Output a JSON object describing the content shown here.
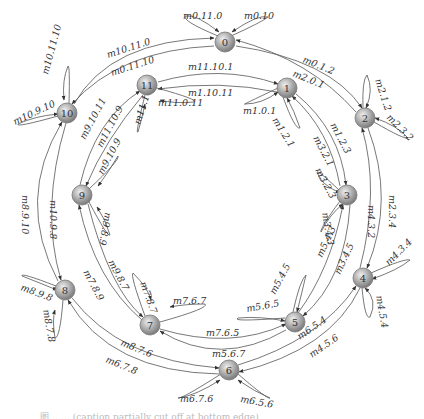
{
  "diagram": {
    "type": "state-transition-ring",
    "nodes": [
      {
        "id": "0",
        "x": 225,
        "y": 42
      },
      {
        "id": "1",
        "x": 287,
        "y": 88
      },
      {
        "id": "2",
        "x": 365,
        "y": 118
      },
      {
        "id": "3",
        "x": 347,
        "y": 195
      },
      {
        "id": "4",
        "x": 363,
        "y": 278
      },
      {
        "id": "5",
        "x": 295,
        "y": 322
      },
      {
        "id": "6",
        "x": 229,
        "y": 370
      },
      {
        "id": "7",
        "x": 150,
        "y": 325
      },
      {
        "id": "8",
        "x": 65,
        "y": 290
      },
      {
        "id": "9",
        "x": 82,
        "y": 195
      },
      {
        "id": "10",
        "x": 67,
        "y": 113
      },
      {
        "id": "11",
        "x": 147,
        "y": 85
      }
    ],
    "edges": [
      {
        "from": "0",
        "to": "2",
        "label": "m0.1.2",
        "path": "M236,46 Q330,60 362,108",
        "lx": 302,
        "ly": 62,
        "rot": 22
      },
      {
        "from": "2",
        "to": "0",
        "label": "m2.0.1",
        "path": "M356,112 Q310,60 236,40",
        "lx": 292,
        "ly": 76,
        "rot": 22
      },
      {
        "from": "0",
        "to": "10",
        "label": "m0.11.10",
        "path": "M214,46 Q120,50 72,104",
        "lx": 112,
        "ly": 76,
        "rot": -18
      },
      {
        "from": "10",
        "to": "0",
        "label": "m10.11.0",
        "path": "M74,104 Q110,40 214,38",
        "lx": 108,
        "ly": 58,
        "rot": -18
      },
      {
        "from": "11",
        "to": "1",
        "label": "m11.10.1",
        "path": "M158,82 Q220,64 278,84",
        "lx": 188,
        "ly": 70,
        "rot": 0
      },
      {
        "from": "1",
        "to": "11",
        "label": "m1.10.11",
        "path": "M277,92 Q220,80 158,89",
        "lx": 188,
        "ly": 96,
        "rot": 0
      },
      {
        "from": "1",
        "to": "3",
        "label": "m1.2.3",
        "path": "M296,94 Q340,130 346,185",
        "lx": 330,
        "ly": 125,
        "rot": 62
      },
      {
        "from": "3",
        "to": "1",
        "label": "m3.2.1",
        "path": "M340,186 Q330,130 292,96",
        "lx": 313,
        "ly": 138,
        "rot": 62
      },
      {
        "from": "2",
        "to": "4",
        "label": "m2.3.4",
        "path": "M368,128 Q395,200 367,268",
        "lx": 389,
        "ly": 195,
        "rot": 90
      },
      {
        "from": "4",
        "to": "2",
        "label": "m4.3.2",
        "path": "M360,268 Q380,190 362,128",
        "lx": 368,
        "ly": 205,
        "rot": 90
      },
      {
        "from": "3",
        "to": "5",
        "label": "m3.4.5",
        "path": "M350,205 Q345,280 303,316",
        "lx": 340,
        "ly": 275,
        "rot": -65
      },
      {
        "from": "5",
        "to": "3",
        "label": "m5.4.3",
        "path": "M298,313 Q330,270 343,205",
        "lx": 322,
        "ly": 258,
        "rot": -65
      },
      {
        "from": "4",
        "to": "6",
        "label": "m4.5.6",
        "path": "M360,288 Q330,350 239,372",
        "lx": 312,
        "ly": 358,
        "rot": -35
      },
      {
        "from": "6",
        "to": "4",
        "label": "m6.5.4",
        "path": "M238,365 Q320,340 356,286",
        "lx": 300,
        "ly": 340,
        "rot": -35
      },
      {
        "from": "7",
        "to": "5",
        "label": "m7.6.5",
        "path": "M160,329 Q230,350 286,324",
        "lx": 206,
        "ly": 336,
        "rot": 0
      },
      {
        "from": "5",
        "to": "7",
        "label": "m5.6.7",
        "path": "M286,330 Q220,368 160,331",
        "lx": 212,
        "ly": 357,
        "rot": 0
      },
      {
        "from": "8",
        "to": "6",
        "label": "m8.7.6",
        "path": "M72,298 Q120,360 219,368",
        "lx": 120,
        "ly": 345,
        "rot": 22
      },
      {
        "from": "6",
        "to": "8",
        "label": "m6.7.8",
        "path": "M219,374 Q110,372 68,300",
        "lx": 105,
        "ly": 362,
        "rot": 22
      },
      {
        "from": "9",
        "to": "7",
        "label": "m9.8.7",
        "path": "M88,204 Q110,290 143,317",
        "lx": 108,
        "ly": 262,
        "rot": 62
      },
      {
        "from": "7",
        "to": "9",
        "label": "m7.8.9",
        "path": "M142,320 Q95,280 79,205",
        "lx": 83,
        "ly": 272,
        "rot": 62
      },
      {
        "from": "10",
        "to": "8",
        "label": "m10.9.8",
        "path": "M66,123 Q40,210 61,280",
        "lx": 50,
        "ly": 200,
        "rot": 90
      },
      {
        "from": "8",
        "to": "10",
        "label": "m8.9.10",
        "path": "M58,281 Q15,200 62,122",
        "lx": 22,
        "ly": 195,
        "rot": 90
      },
      {
        "from": "9",
        "to": "11",
        "label": "m9.10.11",
        "path": "M80,185 Q95,120 140,91",
        "lx": 85,
        "ly": 140,
        "rot": -62
      },
      {
        "from": "11",
        "to": "9",
        "label": "m11.10.9",
        "path": "M143,95 Q105,140 86,186",
        "lx": 102,
        "ly": 148,
        "rot": -62
      }
    ],
    "loops": [
      {
        "node": "0",
        "label": "m0.11.0",
        "path": "M218,36 Q180,20 186,16 Q196,14 219,32",
        "lx": 183,
        "ly": 19,
        "rot": 0
      },
      {
        "node": "0",
        "label": "m0.10",
        "path": "M231,36 Q262,22 268,17 Q258,14 232,32",
        "lx": 244,
        "ly": 19,
        "rot": 0
      },
      {
        "node": "1",
        "label": "m1.0.1",
        "path": "M278,88 Q240,106 245,104 Q262,104 278,92",
        "lx": 243,
        "ly": 114,
        "rot": 0
      },
      {
        "node": "1",
        "label": "m1.2.1",
        "path": "M283,97 Q295,130 300,128 Q294,110 287,98",
        "lx": 272,
        "ly": 120,
        "rot": 58
      },
      {
        "node": "2",
        "label": "m2.1.2",
        "path": "M363,108 Q362,80 367,75 Q374,90 366,108",
        "lx": 375,
        "ly": 80,
        "rot": 72
      },
      {
        "node": "2",
        "label": "m2.3.2",
        "path": "M374,122 Q405,140 408,138 Q398,126 375,118",
        "lx": 386,
        "ly": 118,
        "rot": 45
      },
      {
        "node": "3",
        "label": "m3.2.3",
        "path": "M339,190 Q318,170 317,172 Q320,184 340,193",
        "lx": 315,
        "ly": 170,
        "rot": 62
      },
      {
        "node": "3",
        "label": "m3.4.3",
        "path": "M340,201 Q320,228 321,232 Q330,214 343,204",
        "lx": 322,
        "ly": 213,
        "rot": 80
      },
      {
        "node": "4",
        "label": "m4.3.4",
        "path": "M371,273 Q405,258 410,260 Q398,270 372,279",
        "lx": 389,
        "ly": 266,
        "rot": -45
      },
      {
        "node": "4",
        "label": "m4.5.4",
        "path": "M362,288 Q365,320 370,317 Q378,300 365,288",
        "lx": 376,
        "ly": 296,
        "rot": 80
      },
      {
        "node": "5",
        "label": "m5.4.5",
        "path": "M293,312 Q300,280 306,275 Q302,292 297,312",
        "lx": 275,
        "ly": 295,
        "rot": -62
      },
      {
        "node": "5",
        "label": "m5.6.5",
        "path": "M285,318 Q230,322 238,318 Q260,316 285,321",
        "lx": 247,
        "ly": 312,
        "rot": -10
      },
      {
        "node": "6",
        "label": "m6.7.6",
        "path": "M221,374 Q180,400 178,398 Q195,396 220,380",
        "lx": 180,
        "ly": 402,
        "rot": 0
      },
      {
        "node": "6",
        "label": "m6.5.6",
        "path": "M238,374 Q268,400 270,398 Q255,392 238,380",
        "lx": 240,
        "ly": 402,
        "rot": 10
      },
      {
        "node": "7",
        "label": "m7.6.7",
        "path": "M160,322 Q210,308 205,304 Q185,304 170,307",
        "lx": 173,
        "ly": 304,
        "rot": 0
      },
      {
        "node": "7",
        "label": "m7.8.7",
        "path": "M145,316 Q130,275 133,273 Q148,288 151,300",
        "lx": 140,
        "ly": 283,
        "rot": 70
      },
      {
        "node": "8",
        "label": "m8.9.8",
        "path": "M56,286 Q20,272 22,276 Q40,283 57,290",
        "lx": 20,
        "ly": 290,
        "rot": 20
      },
      {
        "node": "8",
        "label": "m8.7.8",
        "path": "M63,300 Q60,338 55,338 Q52,320 55,310",
        "lx": 43,
        "ly": 310,
        "rot": 80
      },
      {
        "node": "9",
        "label": "m9.10.9",
        "path": "M89,189 Q120,160 118,156 Q110,170 98,186",
        "lx": 103,
        "ly": 175,
        "rot": -62
      },
      {
        "node": "9",
        "label": "m9.8.9",
        "path": "M89,202 Q108,238 110,235 Q106,220 97,207",
        "lx": 105,
        "ly": 212,
        "rot": 100
      },
      {
        "node": "10",
        "label": "m10.11.10",
        "path": "M69,103 Q70,65 68,66 Q62,80 64,100",
        "lx": 48,
        "ly": 75,
        "rot": -75
      },
      {
        "node": "10",
        "label": "m10.9.10",
        "path": "M58,116 Q15,128 18,124 Q35,116 58,114",
        "lx": 15,
        "ly": 125,
        "rot": -25
      },
      {
        "node": "11",
        "label": "m11.0.11",
        "path": "M157,88 Q200,100 194,102 Q175,104 160,100",
        "lx": 158,
        "ly": 106,
        "rot": 0
      },
      {
        "node": "11",
        "label": "m11.10.11",
        "path": "M145,95 Q135,135 138,132 Q142,118 145,104",
        "lx": 140,
        "ly": 125,
        "rot": -72
      }
    ],
    "node_colors": {
      "fill_light": "#e8e8e8",
      "fill_dark": "#8a8a8a",
      "stroke": "#777777"
    }
  },
  "caption": {
    "text": "图 …… (caption partially cut off at bottom edge)"
  }
}
